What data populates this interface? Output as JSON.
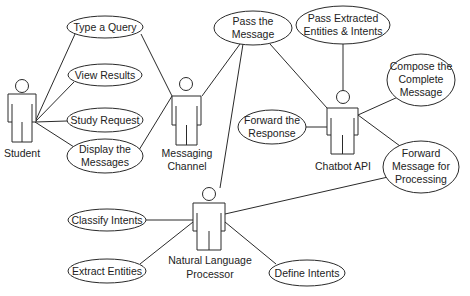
{
  "diagram": {
    "type": "uml-use-case",
    "actors": [
      {
        "id": "student",
        "label": [
          "Student"
        ]
      },
      {
        "id": "messaging-channel",
        "label": [
          "Messaging",
          "Channel"
        ]
      },
      {
        "id": "chatbot-api",
        "label": [
          "Chatbot API"
        ]
      },
      {
        "id": "nlp",
        "label": [
          "Natural Language",
          "Processor"
        ]
      }
    ],
    "use_cases": [
      {
        "id": "type-query",
        "label": [
          "Type a Query"
        ]
      },
      {
        "id": "view-results",
        "label": [
          "View Results"
        ]
      },
      {
        "id": "study-request",
        "label": [
          "Study Request"
        ]
      },
      {
        "id": "display-messages",
        "label": [
          "Display the",
          "Messages"
        ]
      },
      {
        "id": "pass-message",
        "label": [
          "Pass the",
          "Message"
        ]
      },
      {
        "id": "pass-extracted",
        "label": [
          "Pass Extracted",
          "Entities & Intents"
        ]
      },
      {
        "id": "compose-message",
        "label": [
          "Compose the",
          "Complete",
          "Message"
        ]
      },
      {
        "id": "forward-response",
        "label": [
          "Forward the",
          "Response"
        ]
      },
      {
        "id": "forward-processing",
        "label": [
          "Forward",
          "Message for",
          "Processing"
        ]
      },
      {
        "id": "classify-intents",
        "label": [
          "Classify Intents"
        ]
      },
      {
        "id": "extract-entities",
        "label": [
          "Extract Entities"
        ]
      },
      {
        "id": "define-intents",
        "label": [
          "Define Intents"
        ]
      }
    ],
    "associations": [
      [
        "student",
        "type-query"
      ],
      [
        "student",
        "view-results"
      ],
      [
        "student",
        "study-request"
      ],
      [
        "student",
        "display-messages"
      ],
      [
        "messaging-channel",
        "type-query"
      ],
      [
        "messaging-channel",
        "display-messages"
      ],
      [
        "messaging-channel",
        "pass-message"
      ],
      [
        "nlp",
        "pass-message"
      ],
      [
        "chatbot-api",
        "pass-message"
      ],
      [
        "chatbot-api",
        "pass-extracted"
      ],
      [
        "chatbot-api",
        "compose-message"
      ],
      [
        "chatbot-api",
        "forward-response"
      ],
      [
        "chatbot-api",
        "forward-processing"
      ],
      [
        "nlp",
        "forward-processing"
      ],
      [
        "nlp",
        "classify-intents"
      ],
      [
        "nlp",
        "extract-entities"
      ],
      [
        "nlp",
        "define-intents"
      ]
    ]
  }
}
